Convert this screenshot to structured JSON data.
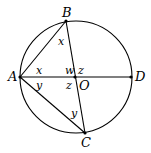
{
  "diagram": {
    "circle": {
      "cx": 76,
      "cy": 77,
      "r": 56,
      "center_label": "O"
    },
    "points": [
      {
        "id": "A",
        "label": "A",
        "x": 20,
        "y": 77
      },
      {
        "id": "B",
        "label": "B",
        "x": 66,
        "y": 21
      },
      {
        "id": "C",
        "label": "C",
        "x": 85,
        "y": 133
      },
      {
        "id": "D",
        "label": "D",
        "x": 131,
        "y": 77
      },
      {
        "id": "X",
        "label": "",
        "x": 75,
        "y": 77
      }
    ],
    "segments": [
      {
        "from": "A",
        "to": "D"
      },
      {
        "from": "A",
        "to": "B"
      },
      {
        "from": "A",
        "to": "C"
      },
      {
        "from": "B",
        "to": "C"
      }
    ],
    "angle_labels": [
      {
        "name": "x-at-B",
        "text": "x"
      },
      {
        "name": "x-at-A",
        "text": "x"
      },
      {
        "name": "y-at-A",
        "text": "y"
      },
      {
        "name": "w",
        "text": "w"
      },
      {
        "name": "z-upper",
        "text": "z"
      },
      {
        "name": "z-lower",
        "text": "z"
      },
      {
        "name": "y-at-C",
        "text": "y"
      }
    ],
    "point_labels": {
      "A": "A",
      "B": "B",
      "C": "C",
      "D": "D",
      "O": "O"
    }
  }
}
